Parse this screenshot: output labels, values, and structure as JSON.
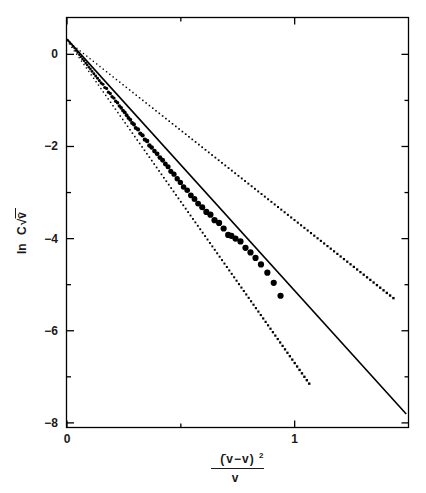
{
  "chart_data": {
    "type": "scatter",
    "title": "",
    "xlabel": "( v̄ − v )² / v",
    "xlabel_parts": {
      "numerator_open": "(",
      "numerator_var_bar": "̄v",
      "numerator_minus": "−",
      "numerator_var": "v",
      "numerator_close": ")",
      "numerator_exponent": "2",
      "denominator": "v"
    },
    "ylabel": "ln C√v̄",
    "ylabel_parts": {
      "prefix": "ln",
      "coefficient": "C",
      "radical": "√",
      "radicand": "v̄"
    },
    "xlim": [
      0,
      1.5
    ],
    "ylim": [
      -8.1,
      0.8
    ],
    "grid": false,
    "legend": "none",
    "x_major_ticks": [
      0,
      1
    ],
    "x_major_tick_labels": [
      "0",
      "1"
    ],
    "x_minor_ticks": [
      0.5,
      1.5
    ],
    "y_major_ticks": [
      0,
      -2,
      -4,
      -6,
      -8
    ],
    "y_major_tick_labels": [
      "0",
      "−2",
      "−4",
      "−6",
      "−8"
    ],
    "y_minor_ticks": [
      -1,
      -3,
      -5,
      -7
    ],
    "series": [
      {
        "name": "fit-line",
        "type": "line",
        "style": "solid",
        "intercept": 0.33,
        "slope": -5.46,
        "x_start": 0.0,
        "x_end": 1.49
      },
      {
        "name": "upper-envelope",
        "type": "line",
        "style": "dotted",
        "intercept": 0.3,
        "slope": -3.9,
        "x_start": 0.0,
        "x_end": 1.44
      },
      {
        "name": "lower-envelope",
        "type": "line",
        "style": "dotted",
        "intercept": 0.3,
        "slope": -7.0,
        "x_start": 0.0,
        "x_end": 1.07
      },
      {
        "name": "data-points",
        "type": "scatter",
        "marker": "filled-circle",
        "points": [
          [
            0.005,
            0.3
          ],
          [
            0.012,
            0.26
          ],
          [
            0.019,
            0.22
          ],
          [
            0.026,
            0.17
          ],
          [
            0.033,
            0.13
          ],
          [
            0.04,
            0.08
          ],
          [
            0.047,
            0.04
          ],
          [
            0.054,
            -0.01
          ],
          [
            0.061,
            -0.05
          ],
          [
            0.068,
            -0.1
          ],
          [
            0.075,
            -0.14
          ],
          [
            0.082,
            -0.19
          ],
          [
            0.089,
            -0.23
          ],
          [
            0.096,
            -0.28
          ],
          [
            0.103,
            -0.32
          ],
          [
            0.11,
            -0.37
          ],
          [
            0.118,
            -0.42
          ],
          [
            0.126,
            -0.47
          ],
          [
            0.134,
            -0.52
          ],
          [
            0.142,
            -0.57
          ],
          [
            0.15,
            -0.62
          ],
          [
            0.158,
            -0.65
          ],
          [
            0.166,
            -0.72
          ],
          [
            0.174,
            -0.74
          ],
          [
            0.182,
            -0.82
          ],
          [
            0.19,
            -0.85
          ],
          [
            0.198,
            -0.92
          ],
          [
            0.206,
            -0.95
          ],
          [
            0.214,
            -1.02
          ],
          [
            0.222,
            -1.05
          ],
          [
            0.23,
            -1.12
          ],
          [
            0.238,
            -1.16
          ],
          [
            0.246,
            -1.22
          ],
          [
            0.254,
            -1.26
          ],
          [
            0.262,
            -1.32
          ],
          [
            0.27,
            -1.38
          ],
          [
            0.278,
            -1.42
          ],
          [
            0.286,
            -1.49
          ],
          [
            0.294,
            -1.52
          ],
          [
            0.302,
            -1.6
          ],
          [
            0.312,
            -1.63
          ],
          [
            0.322,
            -1.72
          ],
          [
            0.332,
            -1.76
          ],
          [
            0.342,
            -1.85
          ],
          [
            0.352,
            -1.88
          ],
          [
            0.362,
            -1.98
          ],
          [
            0.372,
            -2.02
          ],
          [
            0.384,
            -2.1
          ],
          [
            0.396,
            -2.16
          ],
          [
            0.408,
            -2.24
          ],
          [
            0.42,
            -2.3
          ],
          [
            0.432,
            -2.38
          ],
          [
            0.444,
            -2.44
          ],
          [
            0.456,
            -2.54
          ],
          [
            0.47,
            -2.6
          ],
          [
            0.484,
            -2.7
          ],
          [
            0.498,
            -2.78
          ],
          [
            0.512,
            -2.88
          ],
          [
            0.528,
            -2.95
          ],
          [
            0.544,
            -3.06
          ],
          [
            0.56,
            -3.14
          ],
          [
            0.576,
            -3.24
          ],
          [
            0.594,
            -3.32
          ],
          [
            0.612,
            -3.42
          ],
          [
            0.63,
            -3.48
          ],
          [
            0.648,
            -3.6
          ],
          [
            0.668,
            -3.66
          ],
          [
            0.688,
            -3.78
          ],
          [
            0.708,
            -3.92
          ],
          [
            0.722,
            -3.94
          ],
          [
            0.74,
            -4.0
          ],
          [
            0.762,
            -4.06
          ],
          [
            0.784,
            -4.2
          ],
          [
            0.806,
            -4.3
          ],
          [
            0.828,
            -4.42
          ],
          [
            0.852,
            -4.56
          ],
          [
            0.88,
            -4.74
          ],
          [
            0.908,
            -4.96
          ],
          [
            0.938,
            -5.24
          ]
        ]
      }
    ]
  },
  "axes": {
    "frame_color": "#000000",
    "marker_color": "#000000",
    "line_color": "#000000"
  }
}
